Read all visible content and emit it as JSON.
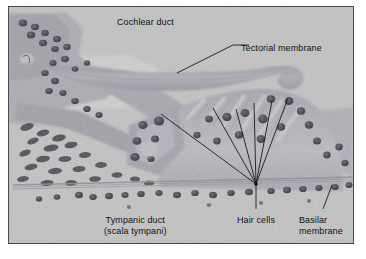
{
  "figure": {
    "type": "light-micrograph",
    "border_color": "#4a4a4a",
    "background_color": "#b9b9b9",
    "label_color": "#111111"
  },
  "labels": {
    "cochlear_duct": "Cochlear duct",
    "tectorial_membrane": "Tectorial membrane",
    "tympanic_duct_line1": "Tympanic duct",
    "tympanic_duct_line2": "(scala tympani)",
    "hair_cells": "Hair cells",
    "basilar_line1": "Basilar",
    "basilar_line2": "membrane"
  }
}
